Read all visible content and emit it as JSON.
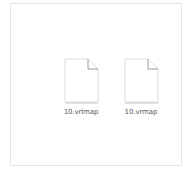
{
  "window": {
    "view": "file-explorer-content-pane"
  },
  "files": [
    {
      "name": "10.vrlmap",
      "icon": "blank-document-icon"
    },
    {
      "name": "10.vrmap",
      "icon": "blank-document-icon"
    }
  ],
  "colors": {
    "border": "#e4e4e4",
    "icon_outline": "#d8d8d8",
    "icon_fold": "#9a9a9a",
    "label_text": "#555555"
  }
}
